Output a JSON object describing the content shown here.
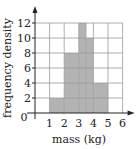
{
  "chart_data": {
    "type": "bar",
    "subtype": "histogram",
    "title": "",
    "xlabel": "mass (kg)",
    "ylabel": "frequency density",
    "xlim": [
      0,
      6
    ],
    "ylim": [
      0,
      12
    ],
    "x_ticks": [
      "1",
      "2",
      "3",
      "4",
      "5",
      "6"
    ],
    "y_ticks": [
      "2",
      "4",
      "6",
      "8",
      "10",
      "12"
    ],
    "origin_label": "0",
    "grid": true,
    "bins": [
      {
        "from": 1,
        "to": 2,
        "value": 2
      },
      {
        "from": 2,
        "to": 3,
        "value": 8
      },
      {
        "from": 3,
        "to": 3.5,
        "value": 12
      },
      {
        "from": 3.5,
        "to": 4,
        "value": 10
      },
      {
        "from": 4,
        "to": 5,
        "value": 4
      }
    ],
    "categories": [
      "1-2",
      "2-3",
      "3-3.5",
      "3.5-4",
      "4-5"
    ],
    "values": [
      2,
      8,
      12,
      10,
      4
    ],
    "colors": {
      "bar": "#b3b3b3",
      "grid": "#9a9a9a",
      "axis": "#222222"
    }
  }
}
